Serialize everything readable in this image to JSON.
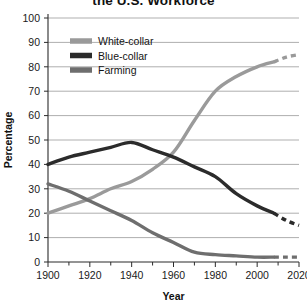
{
  "chart_data": {
    "type": "line",
    "title": "the U.S. Workforce",
    "xlabel": "Year",
    "ylabel": "Percentage",
    "xlim": [
      1900,
      2020
    ],
    "ylim": [
      0,
      100
    ],
    "xticks": [
      1900,
      1920,
      1940,
      1960,
      1980,
      2000,
      2020
    ],
    "xtick_labels": [
      "1900",
      "1920",
      "1940",
      "1960",
      "1980",
      "2000",
      "2020"
    ],
    "xminor_step": 10,
    "yticks": [
      0,
      10,
      20,
      30,
      40,
      50,
      60,
      70,
      80,
      90,
      100
    ],
    "ytick_labels": [
      "0",
      "10",
      "20",
      "30",
      "40",
      "50",
      "60",
      "70",
      "80",
      "90",
      "100"
    ],
    "grid": "horizontal",
    "legend_position": "upper-left-inside",
    "projection_note": "dashed segments after 2008 are projections",
    "series": [
      {
        "name": "White-collar",
        "color": "#9a9a9a",
        "x": [
          1900,
          1910,
          1920,
          1930,
          1940,
          1950,
          1960,
          1970,
          1980,
          1990,
          2000,
          2008
        ],
        "values": [
          20,
          23,
          26,
          30,
          33,
          38,
          45,
          58,
          70,
          76,
          80,
          82
        ],
        "projection_x": [
          2008,
          2014,
          2020
        ],
        "projection_values": [
          82,
          84,
          85
        ]
      },
      {
        "name": "Blue-collar",
        "color": "#2b2b2b",
        "x": [
          1900,
          1910,
          1920,
          1930,
          1940,
          1950,
          1960,
          1970,
          1980,
          1990,
          2000,
          2008
        ],
        "values": [
          40,
          43,
          45,
          47,
          49,
          46,
          43,
          39,
          35,
          28,
          23,
          20
        ],
        "projection_x": [
          2008,
          2014,
          2020
        ],
        "projection_values": [
          20,
          17,
          15
        ]
      },
      {
        "name": "Farming",
        "color": "#6e6e6e",
        "x": [
          1900,
          1910,
          1920,
          1930,
          1940,
          1950,
          1960,
          1970,
          1980,
          1990,
          2000,
          2008
        ],
        "values": [
          32,
          29,
          25,
          21,
          17,
          12,
          8,
          4,
          3,
          2.5,
          2,
          2
        ],
        "projection_x": [
          2008,
          2014,
          2020
        ],
        "projection_values": [
          2,
          2,
          2
        ]
      }
    ]
  },
  "legend": {
    "items": [
      {
        "label": "White-collar"
      },
      {
        "label": "Blue-collar"
      },
      {
        "label": "Farming"
      }
    ]
  }
}
